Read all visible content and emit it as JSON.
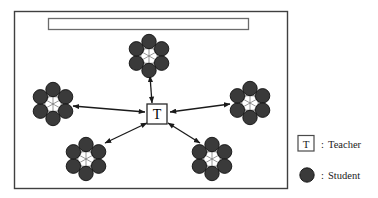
{
  "figure": {
    "classroom": {
      "name": "classroom-frame",
      "border_color": "#3f3f3f",
      "fill_color": "#ffffff",
      "x": 14,
      "y": 11,
      "width": 273,
      "height": 177
    },
    "whiteboard": {
      "name": "whiteboard",
      "label": "",
      "border_color": "#6b6b6b",
      "fill_color": "#ffffff",
      "x": 48,
      "y": 18,
      "width": 200,
      "height": 11
    },
    "teacher": {
      "name": "teacher-node",
      "label": "T",
      "border_color": "#2a2a2a",
      "fill_color": "#ffffff",
      "text_color": "#000000",
      "cx": 157,
      "cy": 114,
      "size": 20
    },
    "student_color": "#3a3a3a",
    "student_stroke": "#111111",
    "student_radius": 7.2,
    "link_color": "#555555",
    "arrow_color": "#1a1a1a",
    "groups": [
      {
        "name": "student-group-top",
        "label": "Group 1",
        "cx": 149,
        "cy": 56,
        "students": 6,
        "ring_radius": 14.5
      },
      {
        "name": "student-group-left",
        "label": "Group 2",
        "cx": 53,
        "cy": 104,
        "students": 6,
        "ring_radius": 14.5
      },
      {
        "name": "student-group-right",
        "label": "Group 3",
        "cx": 250,
        "cy": 103,
        "students": 6,
        "ring_radius": 14.5
      },
      {
        "name": "student-group-bottom-left",
        "label": "Group 4",
        "cx": 86,
        "cy": 159,
        "students": 6,
        "ring_radius": 14.5
      },
      {
        "name": "student-group-bottom-right",
        "label": "Group 5",
        "cx": 212,
        "cy": 159,
        "students": 6,
        "ring_radius": 14.5
      }
    ],
    "connections": [
      {
        "name": "arrow-teacher-top",
        "from": "teacher",
        "to": "student-group-top",
        "bidirectional": true
      },
      {
        "name": "arrow-teacher-left",
        "from": "teacher",
        "to": "student-group-left",
        "bidirectional": true
      },
      {
        "name": "arrow-teacher-right",
        "from": "teacher",
        "to": "student-group-right",
        "bidirectional": true
      },
      {
        "name": "arrow-teacher-bottom-left",
        "from": "teacher",
        "to": "student-group-bottom-left",
        "bidirectional": true
      },
      {
        "name": "arrow-teacher-bottom-right",
        "from": "teacher",
        "to": "student-group-bottom-right",
        "bidirectional": true
      }
    ]
  },
  "legend": {
    "name": "legend",
    "x": 296,
    "y": 132,
    "entries": [
      {
        "key": "teacher",
        "symbol": "square-with-T",
        "symbol_label": "T",
        "separator": ":",
        "label": "Teacher"
      },
      {
        "key": "student",
        "symbol": "filled-circle",
        "symbol_label": "",
        "separator": ":",
        "label": "Student"
      }
    ]
  }
}
